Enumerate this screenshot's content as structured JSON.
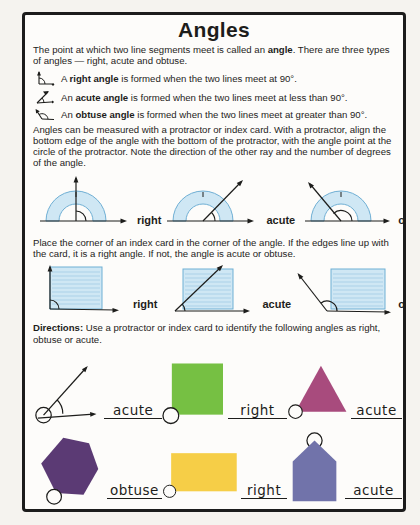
{
  "colors": {
    "ink": "#1d1d1b",
    "protractor_fill": "#cfe7f4",
    "protractor_stroke": "#6fafd4",
    "card_rule": "#9cc8e2",
    "square_green": "#76c043",
    "triangle_magenta": "#a84b7d",
    "hexagon_purple": "#5b3a74",
    "rectangle_yellow": "#f6ce47",
    "pentagon_blue": "#7173aa"
  },
  "doc": {
    "title": "Angles",
    "intro": {
      "pre": "The point at which two line segments meet is called an ",
      "bold": "angle",
      "post": ". There are three types of angles — right, acute and obtuse."
    },
    "bullets": [
      {
        "pre": "A ",
        "bold": "right angle",
        "post": " is formed when the two lines meet at 90°."
      },
      {
        "pre": "An ",
        "bold": "acute angle",
        "post": " is formed when the two lines meet at less than 90°."
      },
      {
        "pre": "An ",
        "bold": "obtuse angle",
        "post": " is formed when the two lines meet at greater than 90°."
      }
    ],
    "protractor_para": "Angles can be measured with a protractor or index card. With a protractor, align the bottom edge of the angle with the bottom of the protractor, with the angle point at the circle of the protractor. Note the direction of the other ray and the number of degrees of the angle.",
    "protractor_examples": [
      {
        "label": "right"
      },
      {
        "label": "acute"
      },
      {
        "label": "obtuse"
      }
    ],
    "card_para": "Place the corner of an index card in the corner of the angle. If the edges line up with the card, it is a right angle. If not, the angle is acute or obtuse.",
    "card_examples": [
      {
        "label": "right"
      },
      {
        "label": "acute"
      },
      {
        "label": "obtuse"
      }
    ],
    "directions": {
      "bold": "Directions:",
      "rest": " Use a protractor or index card to identify the following angles as right, obtuse or acute."
    },
    "exercises": [
      {
        "shape": "angle-figure",
        "answer": "acute"
      },
      {
        "shape": "green-square",
        "answer": "right"
      },
      {
        "shape": "magenta-triangle",
        "answer": "acute"
      },
      {
        "shape": "purple-hexagon",
        "answer": "obtuse"
      },
      {
        "shape": "yellow-rectangle",
        "answer": "right"
      },
      {
        "shape": "blue-pentagon",
        "answer": "acute"
      }
    ]
  }
}
